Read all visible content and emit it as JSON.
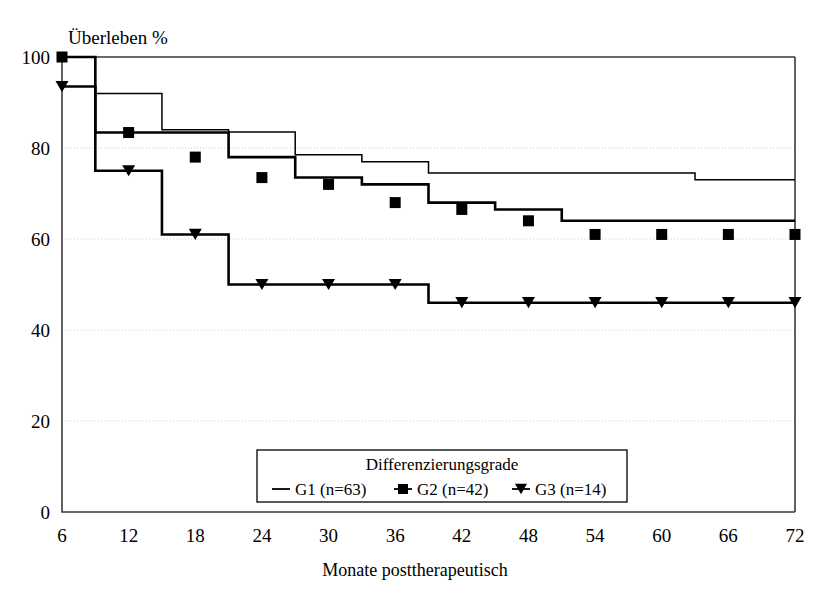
{
  "chart_data": {
    "type": "line",
    "subtype": "kaplan-meier-step",
    "title": "",
    "xlabel": "Monate posttherapeutisch",
    "ylabel": "Überleben %",
    "xlim": [
      6,
      72
    ],
    "ylim": [
      0,
      100
    ],
    "xticks": [
      6,
      12,
      18,
      24,
      30,
      36,
      42,
      48,
      54,
      60,
      66,
      72
    ],
    "yticks": [
      0,
      20,
      40,
      60,
      80,
      100
    ],
    "grid": "horizontal-dotted",
    "legend_position": "bottom-center",
    "legend_title": "Differenzierungsgrade",
    "series": [
      {
        "name": "G1 (n=63)",
        "label": "G1",
        "n": 63,
        "marker": "none",
        "color": "#000000",
        "x": [
          6,
          9,
          9,
          15,
          15,
          21,
          21,
          27,
          27,
          33,
          33,
          39,
          39,
          63,
          63,
          72
        ],
        "y": [
          100,
          100,
          92,
          92,
          84,
          84,
          83.5,
          83.5,
          78.5,
          78.5,
          77,
          77,
          74.5,
          74.5,
          73,
          73
        ],
        "points": [
          {
            "x": 6,
            "y": 100
          },
          {
            "x": 9,
            "y": 92
          },
          {
            "x": 15,
            "y": 84
          },
          {
            "x": 21,
            "y": 83.5
          },
          {
            "x": 27,
            "y": 78.5
          },
          {
            "x": 33,
            "y": 77
          },
          {
            "x": 39,
            "y": 74.5
          },
          {
            "x": 63,
            "y": 73
          },
          {
            "x": 72,
            "y": 73
          }
        ]
      },
      {
        "name": "G2 (n=42)",
        "label": "G2",
        "n": 42,
        "marker": "square",
        "color": "#000000",
        "x": [
          6,
          9,
          9,
          21,
          21,
          27,
          27,
          33,
          33,
          39,
          39,
          45,
          45,
          51,
          51,
          72
        ],
        "y": [
          100,
          100,
          83.4,
          83.4,
          78,
          78,
          73.5,
          73.5,
          72,
          72,
          68,
          68,
          66.5,
          66.5,
          64,
          64
        ],
        "marker_points": [
          {
            "x": 6,
            "y": 100
          },
          {
            "x": 12,
            "y": 83.4
          },
          {
            "x": 18,
            "y": 78
          },
          {
            "x": 24,
            "y": 73.5
          },
          {
            "x": 30,
            "y": 72
          },
          {
            "x": 36,
            "y": 68
          },
          {
            "x": 42,
            "y": 66.5
          },
          {
            "x": 48,
            "y": 64
          },
          {
            "x": 54,
            "y": 61
          },
          {
            "x": 60,
            "y": 61
          },
          {
            "x": 66,
            "y": 61
          },
          {
            "x": 72,
            "y": 61
          }
        ],
        "points": [
          {
            "x": 6,
            "y": 100
          },
          {
            "x": 9,
            "y": 83.4
          },
          {
            "x": 21,
            "y": 78
          },
          {
            "x": 27,
            "y": 73.5
          },
          {
            "x": 33,
            "y": 72
          },
          {
            "x": 39,
            "y": 68
          },
          {
            "x": 45,
            "y": 66.5
          },
          {
            "x": 51,
            "y": 64
          },
          {
            "x": 53,
            "y": 61
          },
          {
            "x": 72,
            "y": 61
          }
        ]
      },
      {
        "name": "G3 (n=14)",
        "label": "G3",
        "n": 14,
        "marker": "triangle-down",
        "color": "#000000",
        "x": [
          6,
          9,
          9,
          15,
          15,
          21,
          21,
          39,
          39,
          72
        ],
        "y": [
          93.5,
          93.5,
          75,
          75,
          61,
          61,
          50,
          50,
          46,
          46
        ],
        "marker_points": [
          {
            "x": 6,
            "y": 93.5
          },
          {
            "x": 12,
            "y": 75
          },
          {
            "x": 18,
            "y": 61
          },
          {
            "x": 24,
            "y": 50
          },
          {
            "x": 30,
            "y": 50
          },
          {
            "x": 36,
            "y": 50
          },
          {
            "x": 42,
            "y": 46
          },
          {
            "x": 48,
            "y": 46
          },
          {
            "x": 54,
            "y": 46
          },
          {
            "x": 60,
            "y": 46
          },
          {
            "x": 66,
            "y": 46
          },
          {
            "x": 72,
            "y": 46
          }
        ],
        "points": [
          {
            "x": 6,
            "y": 93.5
          },
          {
            "x": 9,
            "y": 75
          },
          {
            "x": 15,
            "y": 61
          },
          {
            "x": 21,
            "y": 50
          },
          {
            "x": 39,
            "y": 46
          },
          {
            "x": 72,
            "y": 46
          }
        ]
      }
    ]
  },
  "axes": {
    "y_label": "Überleben %",
    "x_label": "Monate posttherapeutisch",
    "y_ticks": [
      "100",
      "80",
      "60",
      "40",
      "20",
      "0"
    ],
    "x_ticks": [
      "6",
      "12",
      "18",
      "24",
      "30",
      "36",
      "42",
      "48",
      "54",
      "60",
      "66",
      "72"
    ]
  },
  "legend": {
    "title": "Differenzierungsgrade",
    "items": [
      {
        "key": "g1",
        "label": "G1 (n=63)",
        "marker": "line"
      },
      {
        "key": "g2",
        "label": "G2 (n=42)",
        "marker": "square"
      },
      {
        "key": "g3",
        "label": "G3 (n=14)",
        "marker": "triangle-down"
      }
    ]
  },
  "colors": {
    "ink": "#000000",
    "axis": "#3a3a3a",
    "grid": "#cfcfcf",
    "background": "#ffffff"
  }
}
